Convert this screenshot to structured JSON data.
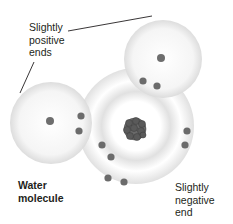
{
  "diagram": {
    "title": "Water molecule",
    "labels": {
      "positive": [
        "Slightly",
        "positive",
        "ends"
      ],
      "negative": [
        "Slightly",
        "negative",
        "end"
      ],
      "molecule": [
        "Water",
        "molecule"
      ]
    },
    "atoms": [
      {
        "name": "hydrogen-top-right",
        "cx": 161,
        "cy": 58
      },
      {
        "name": "hydrogen-left",
        "cx": 50,
        "cy": 121
      },
      {
        "name": "oxygen",
        "cx": 135,
        "cy": 129
      }
    ],
    "electrons": [
      [
        143,
        81
      ],
      [
        157,
        86
      ],
      [
        81,
        116
      ],
      [
        79,
        131
      ],
      [
        102,
        145
      ],
      [
        111,
        157
      ],
      [
        187,
        131
      ],
      [
        185,
        145
      ],
      [
        108,
        178
      ],
      [
        124,
        182
      ]
    ],
    "colors": {
      "electron": "#6b6b6b",
      "glow": "#d9d9d9",
      "text": "#231f20"
    }
  }
}
